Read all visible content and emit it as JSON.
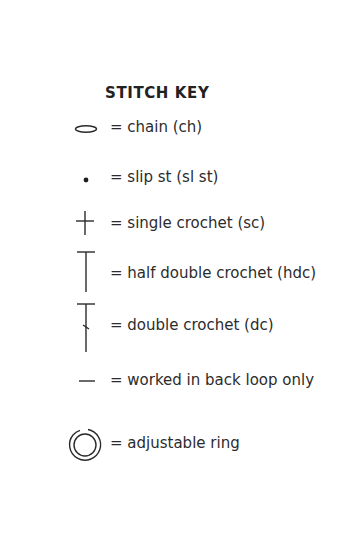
{
  "title": "STITCH KEY",
  "items": [
    {
      "icon": "chain-oval-icon",
      "label": "= chain (ch)"
    },
    {
      "icon": "slip-stitch-dot-icon",
      "label": "= slip st (sl st)"
    },
    {
      "icon": "single-crochet-cross-icon",
      "label": "= single crochet (sc)"
    },
    {
      "icon": "half-double-crochet-t-icon",
      "label": "= half double crochet (hdc)"
    },
    {
      "icon": "double-crochet-t-slash-icon",
      "label": "= double crochet (dc)"
    },
    {
      "icon": "back-loop-dash-icon",
      "label": "= worked in back loop only"
    },
    {
      "icon": "adjustable-ring-icon",
      "label": "= adjustable ring"
    }
  ],
  "colors": {
    "ink": "#2a2a2a",
    "background": "#ffffff"
  }
}
